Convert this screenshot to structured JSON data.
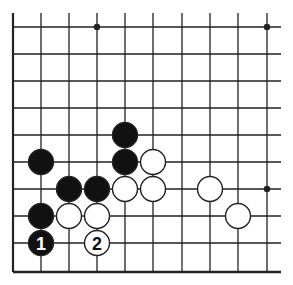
{
  "board": {
    "title": "Go board diagram (lower-left corner)",
    "line_color": "#222222",
    "background": "#ffffff",
    "columns_x": [
      13,
      41,
      69,
      97,
      125,
      153,
      182,
      210,
      238,
      267
    ],
    "rows_y": [
      27,
      54,
      81,
      108,
      135,
      162,
      189,
      216,
      243,
      272
    ],
    "right_extent": 281,
    "top_extent": 13,
    "left_edge_is_border": true,
    "bottom_edge_is_border": true,
    "star_points": [
      {
        "col": 3,
        "row": 0
      },
      {
        "col": 9,
        "row": 0
      },
      {
        "col": 9,
        "row": 6
      }
    ],
    "stones": [
      {
        "color": "black",
        "col": 4,
        "row": 4,
        "label": ""
      },
      {
        "color": "black",
        "col": 1,
        "row": 5,
        "label": ""
      },
      {
        "color": "black",
        "col": 4,
        "row": 5,
        "label": ""
      },
      {
        "color": "white",
        "col": 5,
        "row": 5,
        "label": ""
      },
      {
        "color": "black",
        "col": 2,
        "row": 6,
        "label": ""
      },
      {
        "color": "black",
        "col": 3,
        "row": 6,
        "label": ""
      },
      {
        "color": "white",
        "col": 4,
        "row": 6,
        "label": ""
      },
      {
        "color": "white",
        "col": 5,
        "row": 6,
        "label": ""
      },
      {
        "color": "white",
        "col": 7,
        "row": 6,
        "label": ""
      },
      {
        "color": "black",
        "col": 1,
        "row": 7,
        "label": ""
      },
      {
        "color": "white",
        "col": 2,
        "row": 7,
        "label": ""
      },
      {
        "color": "white",
        "col": 3,
        "row": 7,
        "label": ""
      },
      {
        "color": "white",
        "col": 8,
        "row": 7,
        "label": ""
      },
      {
        "color": "black",
        "col": 1,
        "row": 8,
        "label": "1"
      },
      {
        "color": "white",
        "col": 3,
        "row": 8,
        "label": "2"
      }
    ]
  }
}
